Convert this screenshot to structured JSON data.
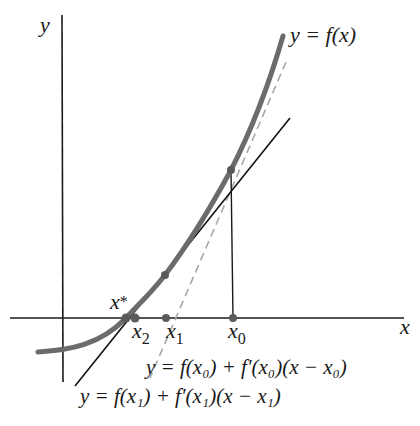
{
  "figure": {
    "colors": {
      "axes": "#1a1a1a",
      "curve": "#6b6b6b",
      "tangent_x1": "#111111",
      "tangent_x0_dashed": "#a8a8a8",
      "points": "#5a5a5a",
      "background": "#ffffff"
    },
    "axes": {
      "x_label": "x",
      "y_label": "y"
    },
    "curve": {
      "label": "y = f(x)"
    },
    "points": {
      "x_star": {
        "label": "x",
        "subscript": "*"
      },
      "x2": {
        "label": "x",
        "subscript": "2"
      },
      "x1": {
        "label": "x",
        "subscript": "1"
      },
      "x0": {
        "label": "x",
        "subscript": "0"
      }
    },
    "tangent_lines": [
      {
        "id": "tangent-at-x0",
        "style": "dashed",
        "label": "y = f(x₀) + f′(x₀)(x − x₀)"
      },
      {
        "id": "tangent-at-x1",
        "style": "solid",
        "label": "y = f(x₁) + f′(x₁)(x − x₁)"
      }
    ]
  }
}
